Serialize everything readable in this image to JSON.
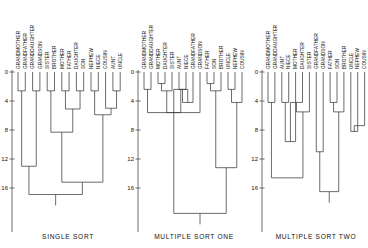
{
  "figure": {
    "width": 368,
    "height": 248,
    "background": "#ffffff",
    "line_color": "#3b3b3b",
    "axis_color": "#4a4a4a"
  },
  "chart_data": {
    "type": "dendrogram",
    "title": "",
    "ylabel": "",
    "ylim": [
      0,
      18
    ],
    "y_ticks": [
      0,
      4,
      8,
      12,
      16
    ],
    "grid": false,
    "legend": null,
    "panels": [
      {
        "caption": "SINGLE SORT",
        "leaves": [
          "GRANDMOTHER",
          "GRANDFATHER",
          "GRANDDAUGHTER",
          "GRANDSON",
          "SISTER",
          "BROTHER",
          "MOTHER",
          "FATHER",
          "DAUGHTER",
          "SON",
          "NEPHEW",
          "NIECE",
          "COUSIN",
          "AUNT",
          "UNCLE"
        ],
        "merges": [
          {
            "a": "GRANDMOTHER",
            "b": "GRANDFATHER",
            "height": 2.6
          },
          {
            "a": "GRANDDAUGHTER",
            "b": "GRANDSON",
            "height": 2.6
          },
          {
            "a": "SISTER",
            "b": "BROTHER",
            "height": 2.6
          },
          {
            "a": "MOTHER",
            "b": "FATHER",
            "height": 2.6
          },
          {
            "a": "DAUGHTER",
            "b": "SON",
            "height": 2.6
          },
          {
            "a": "NEPHEW",
            "b": "NIECE",
            "height": 2.6
          },
          {
            "a": "AUNT",
            "b": "UNCLE",
            "height": 2.6
          },
          {
            "a": "COUSIN",
            "b": "AUNT+UNCLE",
            "height": 5.0
          },
          {
            "a": "MOTHER+FATHER",
            "b": "DAUGHTER+SON",
            "height": 5.1
          },
          {
            "a": "NEPHEW+NIECE",
            "b": "COUSIN+AUNT+UNCLE",
            "height": 5.9
          },
          {
            "a": "SISTER+BROTHER",
            "b": "MOTHER+FATHER+DAUGHTER+SON",
            "height": 8.3
          },
          {
            "a": "GRANDMOTHER+GRANDFATHER",
            "b": "GRANDDAUGHTER+GRANDSON",
            "height": 13.0
          },
          {
            "a": "GM+GF+GD+GS",
            "b": "SISTER..SON",
            "height": 15.2
          },
          {
            "a": "left-cluster",
            "b": "right-cluster",
            "height": 16.9
          }
        ]
      },
      {
        "caption": "MULTIPLE SORT ONE",
        "leaves": [
          "GRANDMOTHER",
          "GRANDDAUGHTER",
          "MOTHER",
          "DAUGHTER",
          "SISTER",
          "AUNT",
          "NIECE",
          "GRANDFATHER",
          "GRANDSON",
          "FATHER",
          "SON",
          "BROTHER",
          "UNCLE",
          "NEPHEW",
          "COUSIN"
        ],
        "merges": [
          {
            "a": "GRANDMOTHER",
            "b": "GRANDDAUGHTER",
            "height": 2.4
          },
          {
            "a": "MOTHER",
            "b": "DAUGHTER",
            "height": 1.6
          },
          {
            "a": "MOTHER+DAUGHTER",
            "b": "SISTER",
            "height": 2.6
          },
          {
            "a": "AUNT",
            "b": "NIECE",
            "height": 2.4
          },
          {
            "a": "MOTHER..SISTER",
            "b": "AUNT+NIECE",
            "height": 4.2
          },
          {
            "a": "GRANDMOTHER+GRANDDAUGHTER",
            "b": "MOTHER..NIECE",
            "height": 5.6
          },
          {
            "a": "GRANDFATHER",
            "b": "GRANDSON",
            "height": 2.4
          },
          {
            "a": "FATHER",
            "b": "SON",
            "height": 1.6
          },
          {
            "a": "FATHER+SON",
            "b": "BROTHER",
            "height": 2.6
          },
          {
            "a": "UNCLE",
            "b": "NEPHEW",
            "height": 2.4
          },
          {
            "a": "FATHER..BROTHER",
            "b": "UNCLE+NEPHEW",
            "height": 4.2
          },
          {
            "a": "GRANDFATHER+GRANDSON",
            "b": "FATHER..NEPHEW",
            "height": 5.6
          },
          {
            "a": "male-cluster",
            "b": "COUSIN",
            "height": 13.2
          },
          {
            "a": "female-cluster",
            "b": "male+COUSIN",
            "height": 19.5
          }
        ]
      },
      {
        "caption": "MULTIPLE SORT TWO",
        "leaves": [
          "GRANDMOTHER",
          "GRANDDAUGHTER",
          "AUNT",
          "NIECE",
          "MOTHER",
          "DAUGHTER",
          "SISTER",
          "GRANDFATHER",
          "GRANDSON",
          "FATHER",
          "SON",
          "BROTHER",
          "UNCLE",
          "NEPHEW",
          "COUSIN"
        ],
        "merges": [
          {
            "a": "GRANDMOTHER",
            "b": "GRANDDAUGHTER",
            "height": 4.2
          },
          {
            "a": "AUNT",
            "b": "NIECE",
            "height": 4.2
          },
          {
            "a": "GM+GD",
            "b": "AUNT+NIECE",
            "height": 9.6
          },
          {
            "a": "MOTHER",
            "b": "DAUGHTER",
            "height": 4.2
          },
          {
            "a": "MOTHER+DAUGHTER",
            "b": "SISTER",
            "height": 5.5
          },
          {
            "a": "GM..NIECE",
            "b": "MOTHER..SISTER",
            "height": 11.0
          },
          {
            "a": "GRANDFATHER",
            "b": "GRANDSON",
            "height": 4.2
          },
          {
            "a": "FATHER",
            "b": "SON",
            "height": 4.2
          },
          {
            "a": "FATHER+SON",
            "b": "BROTHER",
            "height": 5.5
          },
          {
            "a": "GF+GS",
            "b": "FATHER..BROTHER",
            "height": 8.2
          },
          {
            "a": "UNCLE",
            "b": "NEPHEW",
            "height": 4.2
          },
          {
            "a": "UNCLE+NEPHEW",
            "b": "COUSIN",
            "height": 7.4
          },
          {
            "a": "male-core",
            "b": "UNCLE..COUSIN",
            "height": 14.6
          },
          {
            "a": "female-cluster",
            "b": "male-cluster",
            "height": 16.5
          }
        ]
      }
    ]
  }
}
